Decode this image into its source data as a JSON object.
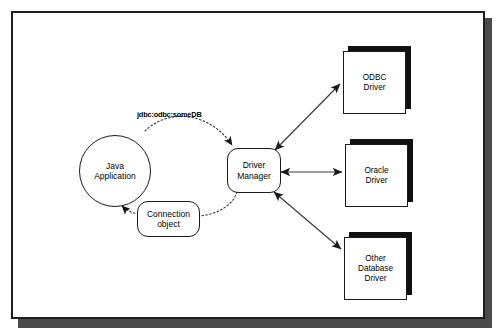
{
  "diagram": {
    "nodes": {
      "java_application": "Java\nApplication",
      "java_application_line1": "Java",
      "java_application_line2": "Application",
      "connection_object_line1": "Connection",
      "connection_object_line2": "object",
      "driver_manager_line1": "Driver",
      "driver_manager_line2": "Manager",
      "odbc_driver_line1": "ODBC",
      "odbc_driver_line2": "Driver",
      "oracle_driver_line1": "Oracle",
      "oracle_driver_line2": "Driver",
      "other_driver_line1": "Other",
      "other_driver_line2": "Database",
      "other_driver_line3": "Driver"
    },
    "labels": {
      "jdbc_url": "jdbc:odbc:someDB"
    },
    "colors": {
      "stroke": "#1a1a1a",
      "frame": "#1d1d1d",
      "shadow": "#4a4a4a",
      "box_shadow": "#111111",
      "background": "#ffffff",
      "dotted_connector": "#2a2a2a",
      "solid_connector": "#3a3a3a"
    },
    "connectors": [
      {
        "from": "java_application",
        "to": "driver_manager",
        "style": "dotted",
        "arrow": "single",
        "label": "jdbc:odbc:someDB"
      },
      {
        "from": "driver_manager",
        "to": "connection_object",
        "style": "dotted",
        "arrow": "none"
      },
      {
        "from": "connection_object",
        "to": "java_application",
        "style": "dotted",
        "arrow": "single"
      },
      {
        "from": "driver_manager",
        "to": "odbc_driver",
        "style": "solid",
        "arrow": "double"
      },
      {
        "from": "driver_manager",
        "to": "oracle_driver",
        "style": "solid",
        "arrow": "double"
      },
      {
        "from": "driver_manager",
        "to": "other_driver",
        "style": "solid",
        "arrow": "double"
      }
    ]
  }
}
